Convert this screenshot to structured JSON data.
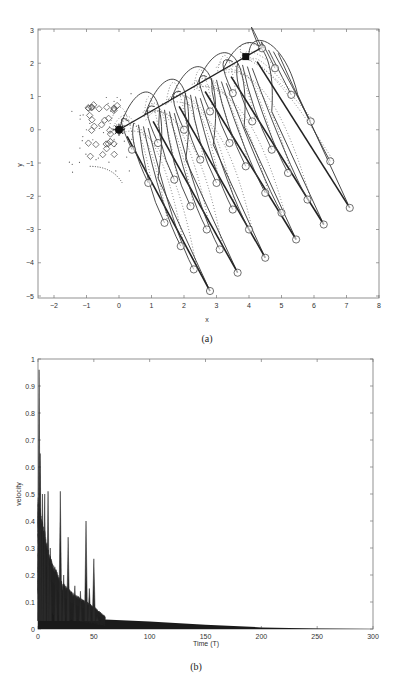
{
  "chart_data": [
    {
      "panel": "a",
      "type": "scatter",
      "caption": "(a)",
      "xlabel": "x",
      "ylabel": "y",
      "xlim": [
        -2.5,
        8
      ],
      "ylim": [
        -5.3,
        3
      ],
      "xticks": [
        -2,
        -1,
        0,
        1,
        2,
        3,
        4,
        5,
        6,
        7,
        8
      ],
      "yticks": [
        -5,
        -4,
        -3,
        -2,
        -1,
        0,
        1,
        2,
        3
      ],
      "grid": false,
      "leader_line": {
        "start": [
          0,
          0
        ],
        "end": [
          4.35,
          2.45
        ]
      },
      "start_marker": {
        "shape": "star",
        "x": 0,
        "y": 0
      },
      "goal_marker": {
        "shape": "filled-square",
        "x": 3.9,
        "y": 2.2
      },
      "fans": [
        {
          "launch": [
            0.0,
            0.0
          ],
          "peak": [
            0.9,
            1.2
          ],
          "end": [
            2.8,
            -4.85
          ],
          "circles": [
            [
              0.4,
              -0.6
            ],
            [
              0.9,
              -1.6
            ],
            [
              1.4,
              -2.8
            ],
            [
              1.9,
              -3.5
            ],
            [
              2.3,
              -4.2
            ],
            [
              2.8,
              -4.85
            ]
          ]
        },
        {
          "launch": [
            0.8,
            0.45
          ],
          "peak": [
            1.7,
            1.55
          ],
          "end": [
            3.65,
            -4.3
          ],
          "circles": [
            [
              1.2,
              -0.4
            ],
            [
              1.7,
              -1.5
            ],
            [
              2.2,
              -2.3
            ],
            [
              2.7,
              -3.0
            ],
            [
              3.1,
              -3.6
            ],
            [
              3.65,
              -4.3
            ]
          ]
        },
        {
          "launch": [
            1.6,
            0.9
          ],
          "peak": [
            2.5,
            1.9
          ],
          "end": [
            4.5,
            -3.85
          ],
          "circles": [
            [
              2.0,
              0.0
            ],
            [
              2.5,
              -0.9
            ],
            [
              3.0,
              -1.6
            ],
            [
              3.5,
              -2.4
            ],
            [
              4.0,
              -3.0
            ],
            [
              4.5,
              -3.85
            ]
          ]
        },
        {
          "launch": [
            2.4,
            1.35
          ],
          "peak": [
            3.3,
            2.3
          ],
          "end": [
            5.45,
            -3.3
          ],
          "circles": [
            [
              2.8,
              0.55
            ],
            [
              3.4,
              -0.4
            ],
            [
              3.9,
              -1.1
            ],
            [
              4.5,
              -1.9
            ],
            [
              5.0,
              -2.5
            ],
            [
              5.45,
              -3.3
            ]
          ]
        },
        {
          "launch": [
            3.2,
            1.8
          ],
          "peak": [
            4.1,
            2.55
          ],
          "end": [
            6.3,
            -2.85
          ],
          "circles": [
            [
              3.5,
              1.1
            ],
            [
              4.1,
              0.25
            ],
            [
              4.7,
              -0.6
            ],
            [
              5.2,
              -1.3
            ],
            [
              5.8,
              -2.1
            ],
            [
              6.3,
              -2.85
            ]
          ]
        },
        {
          "launch": [
            4.0,
            2.25
          ],
          "peak": [
            4.3,
            2.45
          ],
          "end": [
            7.1,
            -2.35
          ],
          "circles": [
            [
              4.4,
              2.45
            ],
            [
              4.8,
              1.85
            ],
            [
              5.3,
              1.05
            ],
            [
              5.9,
              0.25
            ],
            [
              6.5,
              -0.95
            ],
            [
              7.1,
              -2.35
            ]
          ]
        }
      ],
      "diamond_cluster_center": [
        -0.5,
        0.0
      ],
      "diamond_count": 30
    },
    {
      "panel": "b",
      "type": "line",
      "caption": "(b)",
      "xlabel": "Time (T)",
      "ylabel": "velocity",
      "xlim": [
        0,
        300
      ],
      "ylim": [
        0,
        1
      ],
      "xticks": [
        0,
        50,
        100,
        150,
        200,
        250,
        300
      ],
      "yticks": [
        0,
        0.1,
        0.2,
        0.3,
        0.4,
        0.5,
        0.6,
        0.7,
        0.8,
        0.9,
        1
      ],
      "grid": false,
      "spikes": [
        {
          "t": 1,
          "v": 0.96
        },
        {
          "t": 2,
          "v": 0.65
        },
        {
          "t": 4,
          "v": 0.5
        },
        {
          "t": 6,
          "v": 0.5
        },
        {
          "t": 9,
          "v": 0.51
        },
        {
          "t": 11,
          "v": 0.3
        },
        {
          "t": 16,
          "v": 0.22
        },
        {
          "t": 20,
          "v": 0.51
        },
        {
          "t": 23,
          "v": 0.2
        },
        {
          "t": 27,
          "v": 0.34
        },
        {
          "t": 33,
          "v": 0.16
        },
        {
          "t": 38,
          "v": 0.14
        },
        {
          "t": 43,
          "v": 0.4
        },
        {
          "t": 46,
          "v": 0.15
        },
        {
          "t": 50,
          "v": 0.26
        },
        {
          "t": 53,
          "v": 0.05
        }
      ],
      "envelope": [
        {
          "t": 0,
          "v": 0.35
        },
        {
          "t": 10,
          "v": 0.2
        },
        {
          "t": 20,
          "v": 0.13
        },
        {
          "t": 30,
          "v": 0.1
        },
        {
          "t": 40,
          "v": 0.08
        },
        {
          "t": 50,
          "v": 0.06
        },
        {
          "t": 60,
          "v": 0.035
        },
        {
          "t": 100,
          "v": 0.028
        },
        {
          "t": 150,
          "v": 0.016
        },
        {
          "t": 200,
          "v": 0.006
        },
        {
          "t": 250,
          "v": 0.002
        },
        {
          "t": 300,
          "v": 0.0
        }
      ]
    }
  ]
}
